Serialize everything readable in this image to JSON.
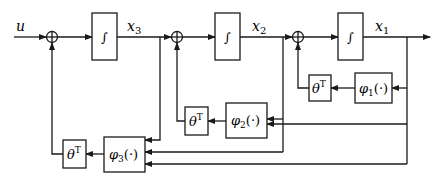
{
  "diagram": {
    "type": "block-diagram",
    "input": {
      "label": "u"
    },
    "integrators": [
      {
        "id": "int3",
        "symbol": "∫",
        "output": "x",
        "output_sub": "3"
      },
      {
        "id": "int2",
        "symbol": "∫",
        "output": "x",
        "output_sub": "2"
      },
      {
        "id": "int1",
        "symbol": "∫",
        "output": "x",
        "output_sub": "1"
      }
    ],
    "summing_junctions": [
      {
        "id": "sum1",
        "symbol": "+"
      },
      {
        "id": "sum2",
        "symbol": "+"
      },
      {
        "id": "sum3",
        "symbol": "+"
      }
    ],
    "regressor_blocks": [
      {
        "id": "phi1",
        "name": "φ",
        "sub": "1",
        "arg": "(·)"
      },
      {
        "id": "phi2",
        "name": "φ",
        "sub": "2",
        "arg": "(·)"
      },
      {
        "id": "phi3",
        "name": "φ",
        "sub": "3",
        "arg": "(·)"
      }
    ],
    "gain_blocks": [
      {
        "id": "theta1",
        "name": "θ",
        "sup": "T"
      },
      {
        "id": "theta2",
        "name": "θ",
        "sup": "T"
      },
      {
        "id": "theta3",
        "name": "θ",
        "sup": "T"
      }
    ],
    "colors": {
      "line": "#1a1a1a",
      "background": "#ffffff"
    }
  }
}
